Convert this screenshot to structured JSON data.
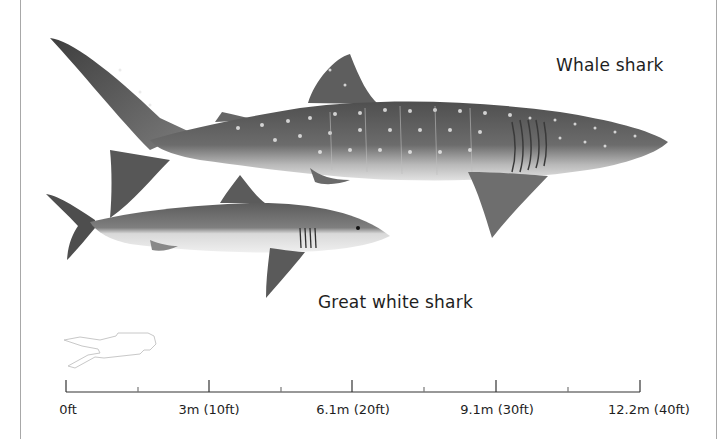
{
  "figure": {
    "species": [
      {
        "name": "Whale shark",
        "label_pos": [
          556,
          55
        ]
      },
      {
        "name": "Great white shark",
        "label_pos": [
          318,
          292
        ]
      }
    ],
    "reference_figure": "scuba-diver-outline",
    "scale": {
      "unit_major": [
        "0ft",
        "3m (10ft)",
        "6.1m (20ft)",
        "9.1m (30ft)",
        "12.2m (40ft)"
      ],
      "major_tick_x": [
        66,
        209,
        352,
        496,
        640
      ],
      "minor_tick_x": [
        138,
        281,
        424,
        568
      ],
      "baseline_y": 392
    },
    "colors": {
      "text": "#1e1e1e",
      "shark_dark": "#5a5a5a",
      "shark_mid": "#8a8a8a",
      "shark_belly": "#e4e4e4",
      "frame": "#a8a8a8"
    }
  }
}
